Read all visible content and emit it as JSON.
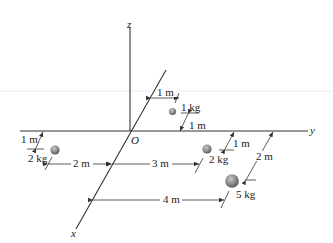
{
  "diagram": {
    "type": "3d-coordinate-point-masses",
    "axes": {
      "x_label": "x",
      "y_label": "y",
      "z_label": "z",
      "origin_label": "O"
    },
    "masses": [
      {
        "id": "m1",
        "label": "1 kg",
        "x_m": -1,
        "y_m": 1,
        "z_m": 0
      },
      {
        "id": "m2a",
        "label": "2 kg",
        "x_m": 1,
        "y_m": -2,
        "z_m": 0
      },
      {
        "id": "m2b",
        "label": "2 kg",
        "x_m": 1,
        "y_m": 3,
        "z_m": 0
      },
      {
        "id": "m5",
        "label": "5 kg",
        "x_m": 2,
        "y_m": 4,
        "z_m": 0
      }
    ],
    "dimensions": {
      "d_1kg_y": "1 m",
      "d_1kg_x": "1 m",
      "d_2kg_left_x": "1 m",
      "d_2kg_left_y": "2 m",
      "d_2kg_right_y": "3 m",
      "d_2kg_right_x": "1 m",
      "d_5kg_x": "2 m",
      "d_5kg_y": "4 m"
    },
    "colors": {
      "line": "#333333",
      "sphere": "#8a8a8a",
      "guide": "#e6e6e6"
    }
  }
}
